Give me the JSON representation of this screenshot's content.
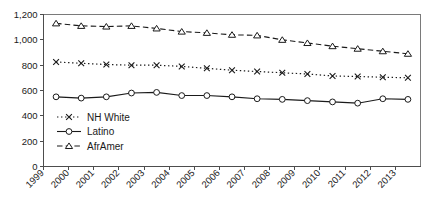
{
  "chart_data": {
    "type": "line",
    "title": "",
    "subtitle": "",
    "xlabel": "",
    "ylabel": "",
    "grid": false,
    "legend_position": "inside-lower-left",
    "x": [
      1999,
      2000,
      2001,
      2002,
      2003,
      2004,
      2005,
      2006,
      2007,
      2008,
      2009,
      2010,
      2011,
      2012,
      2013
    ],
    "categories": [
      "1999",
      "2000",
      "2001",
      "2002",
      "2003",
      "2004",
      "2005",
      "2006",
      "2007",
      "2008",
      "2009",
      "2010",
      "2011",
      "2012",
      "2013"
    ],
    "xlim": [
      1999,
      2014
    ],
    "ylim": [
      0,
      1200
    ],
    "yticks": [
      0,
      200,
      400,
      600,
      800,
      1000,
      1200
    ],
    "ytick_labels": [
      "0",
      "200",
      "400",
      "600",
      "800",
      "1,000",
      "1,200"
    ],
    "series": [
      {
        "name": "NH White",
        "marker": "x",
        "line_style": "dotted",
        "color": "#1a1a1a",
        "values": [
          825,
          815,
          805,
          800,
          800,
          790,
          775,
          760,
          750,
          740,
          730,
          715,
          710,
          705,
          700
        ]
      },
      {
        "name": "Latino",
        "marker": "circle",
        "line_style": "solid",
        "color": "#1a1a1a",
        "values": [
          550,
          540,
          550,
          580,
          585,
          560,
          560,
          550,
          535,
          530,
          520,
          510,
          500,
          535,
          530
        ]
      },
      {
        "name": "AfrAmer",
        "marker": "triangle",
        "line_style": "dashed",
        "color": "#1a1a1a",
        "values": [
          1130,
          1110,
          1105,
          1110,
          1090,
          1065,
          1055,
          1040,
          1035,
          1000,
          975,
          950,
          930,
          910,
          890
        ]
      }
    ]
  },
  "legend": {
    "entries": [
      {
        "label": "NH White",
        "marker": "x",
        "line_style": "dotted"
      },
      {
        "label": "Latino",
        "marker": "circle",
        "line_style": "solid"
      },
      {
        "label": "AfrAmer",
        "marker": "triangle",
        "line_style": "dashed"
      }
    ]
  },
  "axes": {
    "y_tick_labels": [
      "1,200",
      "1,000",
      "800",
      "600",
      "400",
      "200",
      "0"
    ],
    "x_tick_labels": [
      "1999",
      "2000",
      "2001",
      "2002",
      "2003",
      "2004",
      "2005",
      "2006",
      "2007",
      "2008",
      "2009",
      "2010",
      "2011",
      "2012",
      "2013"
    ]
  },
  "colors": {
    "line": "#1a1a1a",
    "axis": "#4d4d4d",
    "frame": "#7a7a7a",
    "background": "#ffffff"
  }
}
